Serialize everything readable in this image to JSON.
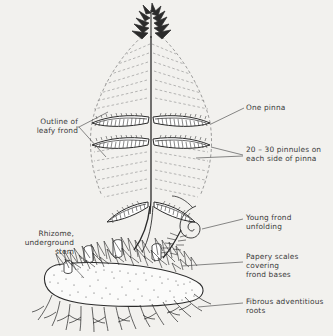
{
  "figure": {
    "style": "black-ink-line-drawing",
    "background_color": "#f2f1ee",
    "ink_color": "#2b2b2b",
    "text_color": "#3a3a3a"
  },
  "labels": {
    "outline_of_leafy_frond": "Outline of\nleafy frond",
    "one_pinna": "One pinna",
    "pinnules": "20 – 30 pinnules on\neach side of pinna",
    "young_frond": "Young frond\nunfolding",
    "rhizome": "Rhizome,\nunderground\nstem",
    "papery_scales": "Papery scales\ncovering\nfrond bases",
    "fibrous_roots": "Fibrous adventitious\nroots"
  },
  "parts": [
    {
      "id": "frond-apex",
      "name": "frond apex tuft"
    },
    {
      "id": "rachis",
      "name": "rachis midrib"
    },
    {
      "id": "pinna-upper-left",
      "name": "upper left pinna"
    },
    {
      "id": "pinna-upper-right",
      "name": "upper right pinna"
    },
    {
      "id": "pinna-lower-left",
      "name": "lower left pinna"
    },
    {
      "id": "pinna-lower-right",
      "name": "lower right pinna"
    },
    {
      "id": "pinna-basal-left",
      "name": "basal left pinna"
    },
    {
      "id": "pinna-basal-right",
      "name": "basal right pinna"
    },
    {
      "id": "frond-outline",
      "name": "dashed leafy frond outline"
    },
    {
      "id": "stipe",
      "name": "stipe stalk"
    },
    {
      "id": "crozier",
      "name": "young frond unfolding crozier"
    },
    {
      "id": "rhizome-body",
      "name": "stippled rhizome"
    },
    {
      "id": "frond-base-stumps",
      "name": "cut frond bases"
    },
    {
      "id": "scales",
      "name": "papery scales"
    },
    {
      "id": "roots",
      "name": "fibrous adventitious roots"
    }
  ]
}
